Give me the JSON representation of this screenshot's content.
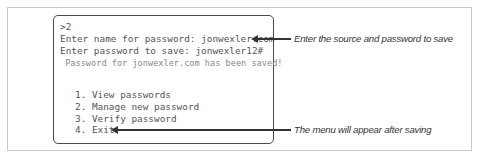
{
  "terminal": {
    "lines": [
      ">2",
      "Enter name for password: jonwexler.com",
      "Enter password to save: jonwexler12#",
      " Password for jonwexler.com has been saved!"
    ],
    "menu": [
      "1. View passwords",
      "2. Manage new password",
      "3. Verify password",
      "4. Exit"
    ]
  },
  "annotations": [
    {
      "text": "Enter the source and password to save"
    },
    {
      "text": "The menu will appear after saving"
    }
  ]
}
